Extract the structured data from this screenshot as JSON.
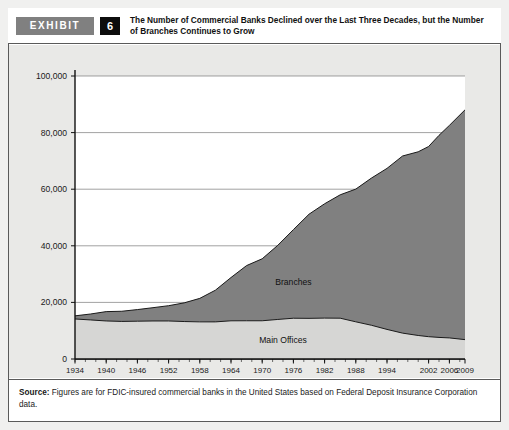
{
  "exhibit": {
    "badge_label": "EXHIBIT",
    "number": "6",
    "title": "The Number of Commercial Banks Declined over the Last Three Decades, but the Number of Branches Continues to Grow"
  },
  "source": {
    "label": "Source:",
    "text": " Figures are for FDIC-insured commercial banks in the United States based on Federal Deposit Insurance Corporation data."
  },
  "colors": {
    "branches_fill": "#808080",
    "main_offices_fill": "#d6d6d4",
    "panel_background": "#e9e9e7",
    "plot_background": "#ffffff",
    "axis": "#111111",
    "gridline": "#7a7a7a",
    "badge_background": "#808080",
    "number_background": "#0d0d0d"
  },
  "chart_data": {
    "type": "area",
    "stacked": true,
    "title": "The Number of Commercial Banks Declined over the Last Three Decades, but the Number of Branches Continues to Grow",
    "xlabel": "",
    "ylabel": "",
    "ylim": [
      0,
      100000
    ],
    "xlim": [
      1934,
      2009
    ],
    "grid": true,
    "legend_position": "inline-annotations",
    "ytick_labels": [
      "0",
      "20,000",
      "40,000",
      "60,000",
      "80,000",
      "100,000"
    ],
    "ytick_values": [
      0,
      20000,
      40000,
      60000,
      80000,
      100000
    ],
    "xtick_labels": [
      "1934",
      "1940",
      "1946",
      "1952",
      "1958",
      "1964",
      "1970",
      "1976",
      "1982",
      "1988",
      "1994",
      "2002",
      "2006",
      "2009"
    ],
    "xtick_values": [
      1934,
      1940,
      1946,
      1952,
      1958,
      1964,
      1970,
      1976,
      1982,
      1988,
      1994,
      2002,
      2006,
      2009
    ],
    "x": [
      1934,
      1937,
      1940,
      1943,
      1946,
      1949,
      1952,
      1955,
      1958,
      1961,
      1964,
      1967,
      1970,
      1973,
      1976,
      1979,
      1982,
      1985,
      1988,
      1991,
      1994,
      1997,
      2000,
      2002,
      2004,
      2006,
      2009
    ],
    "series": [
      {
        "name": "Main Offices",
        "annotation": "Main Offices",
        "values": [
          14146,
          13797,
          13442,
          13274,
          13359,
          13436,
          13439,
          13237,
          13124,
          13115,
          13493,
          13514,
          13511,
          13976,
          14410,
          14364,
          14451,
          14417,
          13137,
          11921,
          10452,
          9143,
          8315,
          7888,
          7630,
          7450,
          6840
        ]
      },
      {
        "name": "Branches",
        "annotation": "Branches",
        "values": [
          1100,
          2100,
          3300,
          3600,
          4100,
          4700,
          5400,
          6600,
          8300,
          11200,
          15300,
          19500,
          21900,
          26200,
          31300,
          36800,
          40400,
          43600,
          46900,
          52000,
          56900,
          62600,
          64900,
          67200,
          71400,
          75100,
          81200
        ]
      }
    ],
    "totals": [
      15246,
      15897,
      16742,
      16874,
      17459,
      18136,
      18839,
      19837,
      21424,
      24315,
      28793,
      33014,
      35411,
      40176,
      45710,
      51164,
      54851,
      58017,
      60037,
      63921,
      67352,
      71743,
      73215,
      75088,
      79030,
      82550,
      88040
    ],
    "annotations": [
      {
        "text": "Branches",
        "x": 1976,
        "y": 26000
      },
      {
        "text": "Main Offices",
        "x": 1974,
        "y": 5600
      }
    ]
  }
}
